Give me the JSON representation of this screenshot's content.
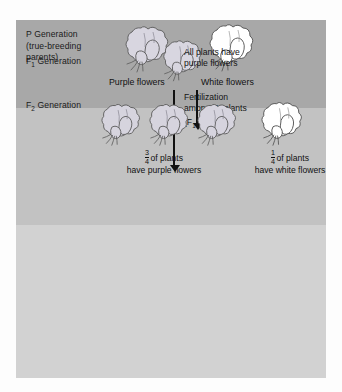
{
  "figure": {
    "generations": [
      {
        "key": "p",
        "label_line1": "P Generation",
        "label_line2": "(true-breeding",
        "label_line3": "parents)",
        "band_color": "#a8a8a8"
      },
      {
        "key": "f1",
        "label_prefix": "F",
        "label_sub": "1",
        "label_suffix": " Generation",
        "band_color": "#c2c2c2"
      },
      {
        "key": "f2",
        "label_prefix": "F",
        "label_sub": "2",
        "label_suffix": " Generation",
        "band_color": "#d2d2d2"
      }
    ],
    "p_generation": {
      "cross_symbol": "×",
      "parent_left_caption": "Purple flowers",
      "parent_right_caption": "White flowers",
      "parent_left_color": "#d8d6e0",
      "parent_right_color": "#ffffff"
    },
    "f1_generation": {
      "note_line1": "All plants have",
      "note_line2": "purple flowers",
      "fertilization_line1": "Fertilization",
      "fertilization_line2_a": "among F",
      "fertilization_line2_sub": "1",
      "fertilization_line2_b": " plants",
      "fertilization_line3_a": "(F",
      "fertilization_line3_sub1": "1",
      "fertilization_line3_x": " × F",
      "fertilization_line3_sub2": "1",
      "fertilization_line3_end": ")"
    },
    "f2_generation": {
      "purple_count": 3,
      "white_count": 1,
      "left_fraction_num": "3",
      "left_fraction_den": "4",
      "left_caption_line1": "of plants",
      "left_caption_line2": "have purple flowers",
      "right_fraction_num": "1",
      "right_fraction_den": "4",
      "right_caption_line1": "of plants",
      "right_caption_line2": "have white flowers"
    }
  }
}
